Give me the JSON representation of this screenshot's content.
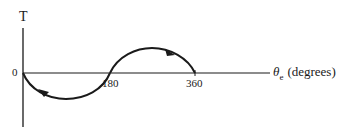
{
  "diagram": {
    "y_axis": {
      "label": "T"
    },
    "x_axis": {
      "symbol": "θ",
      "subscript": "e",
      "unit": "(degrees)",
      "origin_label": "0",
      "ticks": [
        "180",
        "360"
      ]
    },
    "curve": {
      "description": "One full sine-like cycle from 0 to 360: negative lobe between 0 and 180, positive lobe between 180 and 360",
      "direction_arrows": [
        {
          "position": "negative lobe near 0",
          "points": "toward origin (left-up)"
        },
        {
          "position": "positive lobe near 270",
          "points": "toward 360 (right-down)"
        }
      ]
    },
    "colors": {
      "stroke": "#1a1a1a",
      "background": "#ffffff"
    }
  }
}
